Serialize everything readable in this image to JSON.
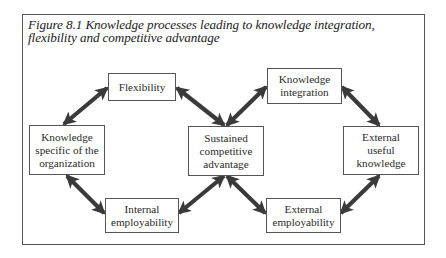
{
  "figure": {
    "caption_lines": [
      "Figure 8.1  Knowledge processes leading to knowledge integration,",
      "flexibility and competitive advantage"
    ]
  },
  "nodes": {
    "flexibility": {
      "lines": [
        "Flexibility"
      ]
    },
    "knowledge_specific": {
      "lines": [
        "Knowledge",
        "specific of the",
        "organization"
      ]
    },
    "sustained_advantage": {
      "lines": [
        "Sustained",
        "competitive",
        "advantage"
      ]
    },
    "knowledge_integration": {
      "lines": [
        "Knowledge",
        "integration"
      ]
    },
    "external_useful_knowledge": {
      "lines": [
        "External",
        "useful",
        "knowledge"
      ]
    },
    "internal_employability": {
      "lines": [
        "Internal",
        "employability"
      ]
    },
    "external_employability": {
      "lines": [
        "External",
        "employability"
      ]
    }
  },
  "edges": [
    {
      "from": "knowledge_specific",
      "to": "flexibility",
      "type": "double-arrow"
    },
    {
      "from": "flexibility",
      "to": "sustained_advantage",
      "type": "double-arrow"
    },
    {
      "from": "sustained_advantage",
      "to": "knowledge_integration",
      "type": "double-arrow"
    },
    {
      "from": "knowledge_integration",
      "to": "external_useful_knowledge",
      "type": "double-arrow"
    },
    {
      "from": "knowledge_specific",
      "to": "internal_employability",
      "type": "double-arrow"
    },
    {
      "from": "internal_employability",
      "to": "sustained_advantage",
      "type": "double-arrow"
    },
    {
      "from": "sustained_advantage",
      "to": "external_employability",
      "type": "double-arrow"
    },
    {
      "from": "external_employability",
      "to": "external_useful_knowledge",
      "type": "double-arrow"
    }
  ],
  "colors": {
    "arrow_fill": "#3a3a3a",
    "box_border": "#555555",
    "text": "#2a2a2a"
  }
}
